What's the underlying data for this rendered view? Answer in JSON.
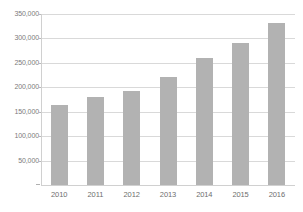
{
  "chart_data": {
    "type": "bar",
    "title": "",
    "subtitle": "",
    "xlabel": "",
    "ylabel": "",
    "categories": [
      "2010",
      "2011",
      "2012",
      "2013",
      "2014",
      "2015",
      "2016"
    ],
    "values": [
      163000,
      180000,
      192000,
      222000,
      260000,
      291000,
      331000
    ],
    "series": [
      {
        "name": "",
        "values": [
          163000,
          180000,
          192000,
          222000,
          260000,
          291000,
          331000
        ]
      }
    ],
    "ylim": [
      0,
      350000
    ],
    "ytick_values": [
      50000,
      100000,
      150000,
      200000,
      250000,
      300000,
      350000
    ],
    "ytick_labels": [
      "50,000",
      "100,000",
      "150,000",
      "200,000",
      "250,000",
      "300,000",
      "350,000"
    ],
    "xtick_labels": [
      "2010",
      "2011",
      "2012",
      "2013",
      "2014",
      "2015",
      "2016"
    ],
    "grid": true,
    "grid_axis": "y",
    "legend": false,
    "legend_position": "none",
    "annotations": [],
    "colors": {
      "bar": "#b2b2b2",
      "gridline": "#d9d9d9",
      "axis": "#d0d0d0",
      "tick_label": "#7b7b7b",
      "background": "#ffffff"
    }
  }
}
